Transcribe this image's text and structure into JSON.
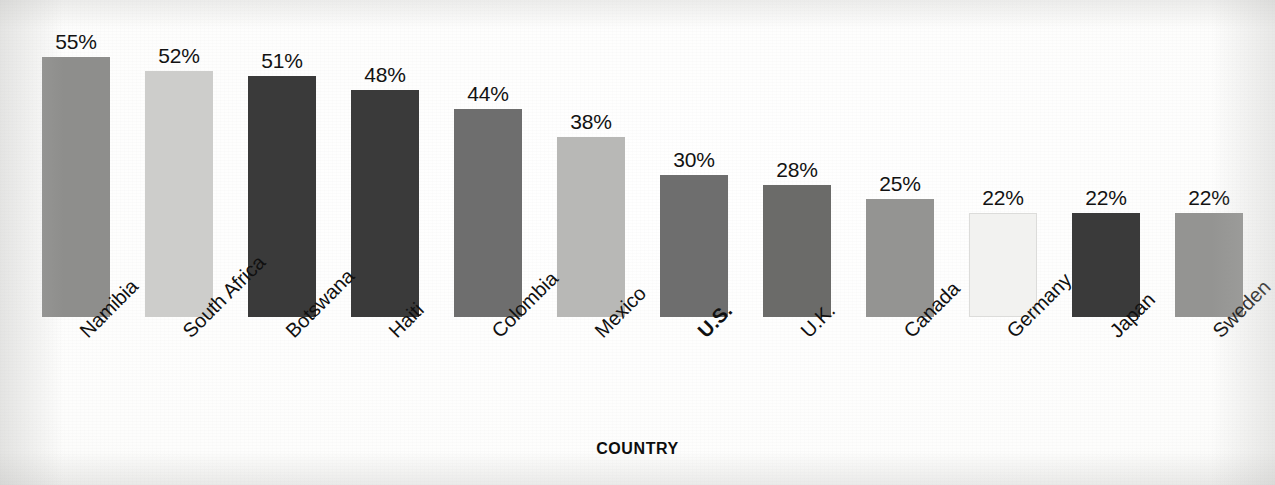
{
  "chart_data": {
    "type": "bar",
    "title": "",
    "subtitle": "",
    "xlabel": "COUNTRY",
    "ylabel": "",
    "ylim": [
      0,
      55
    ],
    "grid": false,
    "legend": "none",
    "value_suffix": "%",
    "categories": [
      "Namibia",
      "South Africa",
      "Botswana",
      "Haiti",
      "Colombia",
      "Mexico",
      "U.S.",
      "U.K.",
      "Canada",
      "Germany",
      "Japan",
      "Sweden"
    ],
    "values": [
      55,
      52,
      51,
      48,
      44,
      38,
      30,
      28,
      25,
      22,
      22,
      22
    ],
    "value_labels": [
      "55%",
      "52%",
      "51%",
      "48%",
      "44%",
      "38%",
      "30%",
      "28%",
      "25%",
      "22%",
      "22%",
      "22%"
    ],
    "bar_colors": [
      "#8e8e8c",
      "#cdcdcb",
      "#3a3a3a",
      "#3a3a3a",
      "#6e6e6e",
      "#b8b8b6",
      "#6e6e6e",
      "#6b6b69",
      "#949492",
      "#f2f2f0",
      "#3a3a3a",
      "#949492"
    ],
    "emphasized_category": "U.S.",
    "bars": [
      {
        "label": "Namibia",
        "value": 55,
        "value_label": "55%",
        "color": "#8e8e8c",
        "emphasis": false
      },
      {
        "label": "South Africa",
        "value": 52,
        "value_label": "52%",
        "color": "#cdcdcb",
        "emphasis": false
      },
      {
        "label": "Botswana",
        "value": 51,
        "value_label": "51%",
        "color": "#3a3a3a",
        "emphasis": false
      },
      {
        "label": "Haiti",
        "value": 48,
        "value_label": "48%",
        "color": "#3a3a3a",
        "emphasis": false
      },
      {
        "label": "Colombia",
        "value": 44,
        "value_label": "44%",
        "color": "#6e6e6e",
        "emphasis": false
      },
      {
        "label": "Mexico",
        "value": 38,
        "value_label": "38%",
        "color": "#b8b8b6",
        "emphasis": false
      },
      {
        "label": "U.S.",
        "value": 30,
        "value_label": "30%",
        "color": "#6e6e6e",
        "emphasis": true
      },
      {
        "label": "U.K.",
        "value": 28,
        "value_label": "28%",
        "color": "#6b6b69",
        "emphasis": false
      },
      {
        "label": "Canada",
        "value": 25,
        "value_label": "25%",
        "color": "#949492",
        "emphasis": false
      },
      {
        "label": "Germany",
        "value": 22,
        "value_label": "22%",
        "color": "#f2f2f0",
        "emphasis": false
      },
      {
        "label": "Japan",
        "value": 22,
        "value_label": "22%",
        "color": "#3a3a3a",
        "emphasis": false
      },
      {
        "label": "Sweden",
        "value": 22,
        "value_label": "22%",
        "color": "#949492",
        "emphasis": false
      }
    ]
  },
  "layout": {
    "first_bar_x": 42,
    "bar_width": 68,
    "bar_pitch": 103,
    "baseline_y": 317,
    "px_per_unit": 4.73
  }
}
